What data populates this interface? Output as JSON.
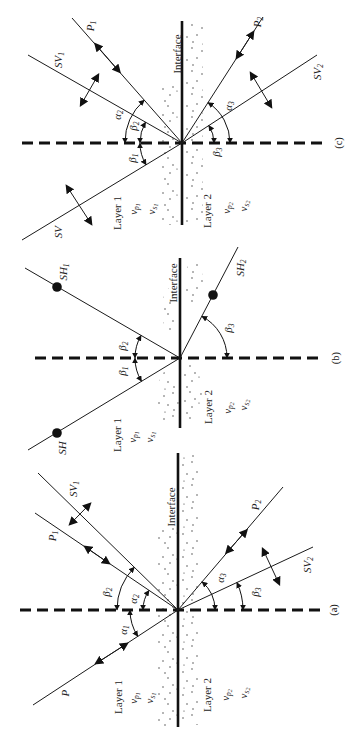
{
  "figure": {
    "panels": {
      "c": {
        "caption": "(c)",
        "interface_label": "Interface",
        "layer1": {
          "name": "Layer 1",
          "vp": {
            "base": "v",
            "sub": "p",
            "subsub": "1"
          },
          "vs": {
            "base": "v",
            "sub": "s",
            "subsub": "1"
          }
        },
        "layer2": {
          "name": "Layer 2",
          "vp": {
            "base": "v",
            "sub": "p",
            "subsub": "2"
          },
          "vs": {
            "base": "v",
            "sub": "s",
            "subsub": "2"
          }
        },
        "rays": {
          "incident": {
            "base": "SV",
            "sub": ""
          },
          "reflected_p": {
            "base": "P",
            "sub": "1"
          },
          "reflected_sv": {
            "base": "SV",
            "sub": "1"
          },
          "transmitted_p": {
            "base": "P",
            "sub": "2"
          },
          "transmitted_sv": {
            "base": "SV",
            "sub": "2"
          }
        },
        "angles": {
          "reflected_p": {
            "base": "α",
            "sub": "2"
          },
          "reflected_sv": {
            "base": "β",
            "sub": "2"
          },
          "incident": {
            "base": "β",
            "sub": "1"
          },
          "transmitted_p": {
            "base": "α",
            "sub": "3"
          },
          "transmitted_sv": {
            "base": "β",
            "sub": "3"
          }
        }
      },
      "b": {
        "caption": "(b)",
        "interface_label": "Interface",
        "layer1": {
          "name": "Layer 1",
          "vp": {
            "base": "v",
            "sub": "p",
            "subsub": "1"
          },
          "vs": {
            "base": "v",
            "sub": "s",
            "subsub": "1"
          }
        },
        "layer2": {
          "name": "Layer 2",
          "vp": {
            "base": "v",
            "sub": "p",
            "subsub": "2"
          },
          "vs": {
            "base": "v",
            "sub": "s",
            "subsub": "2"
          }
        },
        "rays": {
          "incident": {
            "base": "SH",
            "sub": ""
          },
          "reflected_sh": {
            "base": "SH",
            "sub": "1"
          },
          "transmitted_sh": {
            "base": "SH",
            "sub": "2"
          }
        },
        "angles": {
          "incident": {
            "base": "β",
            "sub": "1"
          },
          "reflected_sh": {
            "base": "β",
            "sub": "2"
          },
          "transmitted_sh": {
            "base": "β",
            "sub": "3"
          }
        }
      },
      "a": {
        "caption": "(a)",
        "interface_label": "Interface",
        "layer1": {
          "name": "Layer 1",
          "vp": {
            "base": "v",
            "sub": "p",
            "subsub": "1"
          },
          "vs": {
            "base": "v",
            "sub": "s",
            "subsub": "1"
          }
        },
        "layer2": {
          "name": "Layer 2",
          "vp": {
            "base": "v",
            "sub": "p",
            "subsub": "2"
          },
          "vs": {
            "base": "v",
            "sub": "s",
            "subsub": "2"
          }
        },
        "rays": {
          "incident": {
            "base": "P",
            "sub": ""
          },
          "reflected_p": {
            "base": "P",
            "sub": "1"
          },
          "reflected_sv": {
            "base": "SV",
            "sub": "1"
          },
          "transmitted_p": {
            "base": "P",
            "sub": "2"
          },
          "transmitted_sv": {
            "base": "SV",
            "sub": "2"
          }
        },
        "angles": {
          "incident": {
            "base": "α",
            "sub": "1"
          },
          "reflected_p": {
            "base": "α",
            "sub": "2"
          },
          "reflected_sv": {
            "base": "β",
            "sub": "2"
          },
          "transmitted_p": {
            "base": "α",
            "sub": "3"
          },
          "transmitted_sv": {
            "base": "β",
            "sub": "3"
          }
        }
      }
    }
  }
}
